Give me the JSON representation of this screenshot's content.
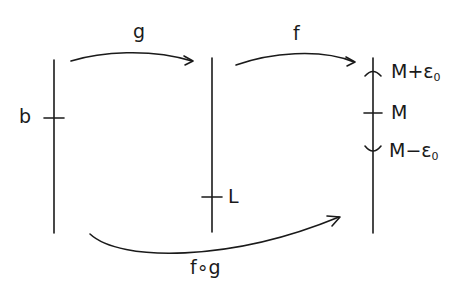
{
  "diagram": {
    "axes": [
      {
        "id": "domain",
        "x": 54,
        "y1": 60,
        "y2": 233
      },
      {
        "id": "middle",
        "x": 212,
        "y1": 58,
        "y2": 232
      },
      {
        "id": "codomain",
        "x": 373,
        "y1": 58,
        "y2": 233
      }
    ],
    "ticks": {
      "b": {
        "label": "b",
        "axis": "domain",
        "y": 118
      },
      "L": {
        "label": "L",
        "axis": "middle",
        "y": 197
      },
      "M_plus": {
        "label": "M+ε",
        "sub": "0",
        "axis": "codomain",
        "y": 72,
        "shape": "cap"
      },
      "M": {
        "label": "M",
        "axis": "codomain",
        "y": 113
      },
      "M_minus": {
        "label": "M−ε",
        "sub": "0",
        "axis": "codomain",
        "y": 150,
        "shape": "cup"
      }
    },
    "arrows": {
      "g": {
        "label": "g",
        "from": "domain",
        "to": "middle"
      },
      "f": {
        "label": "f",
        "from": "middle",
        "to": "codomain"
      },
      "fog": {
        "label": "f∘g",
        "from": "domain",
        "to": "codomain"
      }
    },
    "stroke_color": "#1a1a1a",
    "background": "#ffffff"
  }
}
